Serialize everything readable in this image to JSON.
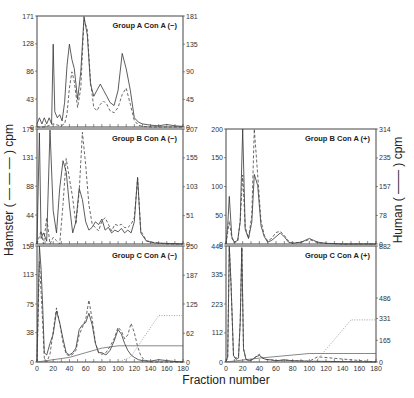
{
  "figure": {
    "xlabel": "Fraction number",
    "ylabel_left": "Hamster ( — — — ) cpm",
    "ylabel_right": "Human ( —— ) cpm"
  },
  "chart_data": [
    {
      "type": "line",
      "title": "Group A Con A (−)",
      "xlim": [
        0,
        180
      ],
      "xticks": [],
      "ylim_left": [
        0,
        171
      ],
      "yticks_left": [
        0,
        43,
        86,
        128,
        171
      ],
      "ylim_right": [
        0,
        181
      ],
      "yticks_right": [
        0,
        45,
        90,
        135,
        181
      ],
      "series": [
        {
          "name": "Human (solid)",
          "axis": "right",
          "x": [
            0,
            3,
            6,
            9,
            12,
            15,
            18,
            20,
            22,
            25,
            28,
            31,
            34,
            37,
            40,
            43,
            46,
            50,
            54,
            58,
            62,
            66,
            70,
            74,
            78,
            82,
            86,
            90,
            95,
            100,
            105,
            110,
            115,
            120,
            125,
            130,
            140,
            150,
            160,
            170,
            180
          ],
          "y": [
            5,
            15,
            5,
            15,
            5,
            15,
            5,
            135,
            25,
            15,
            20,
            10,
            40,
            100,
            135,
            110,
            95,
            45,
            90,
            180,
            150,
            70,
            50,
            60,
            70,
            60,
            50,
            40,
            35,
            60,
            120,
            95,
            60,
            15,
            8,
            5,
            3,
            2,
            4,
            2,
            1
          ]
        },
        {
          "name": "Hamster (dashed)",
          "axis": "left",
          "x": [
            0,
            10,
            20,
            25,
            30,
            34,
            37,
            40,
            43,
            46,
            50,
            54,
            58,
            62,
            66,
            70,
            74,
            78,
            82,
            86,
            90,
            95,
            100,
            105,
            110,
            115,
            120,
            125,
            130,
            140,
            150,
            160,
            170,
            180
          ],
          "y": [
            0,
            0,
            5,
            3,
            2,
            5,
            20,
            60,
            85,
            70,
            30,
            60,
            165,
            150,
            70,
            30,
            25,
            35,
            40,
            35,
            25,
            22,
            30,
            50,
            60,
            35,
            10,
            3,
            1,
            0,
            0,
            0,
            0,
            0
          ]
        }
      ]
    },
    {
      "type": "line",
      "title": "Group B Con A (−)",
      "xlim": [
        0,
        180
      ],
      "xticks": [],
      "ylim_left": [
        0,
        175
      ],
      "yticks_left": [
        0,
        44,
        88,
        131,
        175
      ],
      "ylim_right": [
        0,
        207
      ],
      "yticks_right": [
        0,
        51,
        103,
        155,
        207
      ],
      "series": [
        {
          "name": "Human (solid)",
          "axis": "right",
          "x": [
            0,
            3,
            5,
            8,
            12,
            16,
            20,
            24,
            28,
            32,
            36,
            40,
            44,
            48,
            52,
            56,
            60,
            64,
            68,
            72,
            76,
            80,
            84,
            88,
            92,
            96,
            100,
            104,
            108,
            112,
            116,
            120,
            124,
            128,
            135,
            145,
            160,
            180
          ],
          "y": [
            0,
            200,
            10,
            20,
            5,
            205,
            60,
            20,
            100,
            150,
            130,
            70,
            20,
            40,
            100,
            80,
            40,
            25,
            30,
            40,
            35,
            45,
            25,
            30,
            20,
            25,
            22,
            28,
            20,
            25,
            20,
            40,
            120,
            20,
            5,
            2,
            1,
            0
          ]
        },
        {
          "name": "Hamster (dashed)",
          "axis": "left",
          "x": [
            0,
            5,
            8,
            12,
            16,
            20,
            24,
            28,
            32,
            36,
            40,
            44,
            48,
            52,
            56,
            60,
            64,
            68,
            72,
            76,
            80,
            84,
            88,
            92,
            96,
            100,
            104,
            108,
            112,
            116,
            120,
            124,
            128,
            135,
            145,
            160,
            180
          ],
          "y": [
            0,
            20,
            0,
            40,
            0,
            10,
            5,
            0,
            60,
            130,
            100,
            70,
            30,
            80,
            170,
            120,
            60,
            30,
            25,
            20,
            35,
            40,
            30,
            20,
            30,
            28,
            30,
            25,
            25,
            30,
            40,
            100,
            20,
            5,
            2,
            0,
            0
          ]
        }
      ]
    },
    {
      "type": "line",
      "title": "Group C Con A (−)",
      "xlim": [
        0,
        180
      ],
      "xticks": [
        0,
        20,
        40,
        60,
        80,
        100,
        120,
        140,
        160,
        180
      ],
      "ylim_left": [
        0,
        150
      ],
      "yticks_left": [
        0,
        38,
        75,
        113,
        150
      ],
      "ylim_right": [
        0,
        250
      ],
      "yticks_right": [
        0,
        62,
        125,
        187,
        250
      ],
      "series": [
        {
          "name": "Human (solid)",
          "axis": "right",
          "x": [
            0,
            3,
            5,
            7,
            9,
            12,
            16,
            20,
            24,
            28,
            32,
            36,
            40,
            44,
            48,
            52,
            56,
            60,
            64,
            68,
            72,
            76,
            80,
            85,
            90,
            95,
            100,
            104,
            108,
            112,
            116,
            120,
            125,
            130,
            140,
            150,
            160,
            170,
            180
          ],
          "y": [
            0,
            250,
            200,
            120,
            20,
            15,
            40,
            60,
            110,
            85,
            50,
            20,
            15,
            20,
            30,
            70,
            80,
            85,
            105,
            80,
            40,
            20,
            20,
            15,
            25,
            45,
            70,
            60,
            40,
            25,
            15,
            10,
            5,
            3,
            2,
            5,
            3,
            1,
            0
          ]
        },
        {
          "name": "Hamster (dashed)",
          "axis": "left",
          "x": [
            0,
            3,
            5,
            7,
            9,
            12,
            16,
            20,
            24,
            28,
            32,
            36,
            40,
            44,
            48,
            52,
            56,
            60,
            64,
            68,
            72,
            76,
            80,
            85,
            90,
            95,
            100,
            104,
            108,
            112,
            116,
            120,
            124,
            128,
            132,
            136,
            140,
            150,
            160,
            170,
            180
          ],
          "y": [
            0,
            130,
            90,
            50,
            5,
            0,
            10,
            40,
            70,
            50,
            25,
            10,
            8,
            10,
            15,
            35,
            45,
            55,
            80,
            55,
            25,
            12,
            10,
            12,
            20,
            30,
            45,
            40,
            30,
            35,
            50,
            38,
            20,
            8,
            3,
            1,
            0,
            0,
            0,
            0,
            0
          ]
        },
        {
          "name": "Gradient (solid, flat)",
          "axis": "right",
          "x": [
            0,
            20,
            40,
            60,
            80,
            100,
            180
          ],
          "y": [
            0,
            5,
            10,
            20,
            30,
            35,
            35
          ]
        },
        {
          "name": "Gradient (dotted)",
          "axis": "right",
          "x": [
            0,
            100,
            115,
            150,
            180
          ],
          "y": [
            0,
            0,
            10,
            100,
            100
          ]
        }
      ]
    },
    {
      "type": "line",
      "title": "Group B Con A (+)",
      "xlim": [
        0,
        180
      ],
      "xticks": [],
      "ylim_left": [
        0,
        200
      ],
      "yticks_left": [
        0,
        50,
        100,
        150,
        200
      ],
      "ylim_right": [
        0,
        314
      ],
      "yticks_right": [
        0,
        78,
        157,
        235,
        314
      ],
      "series": [
        {
          "name": "Human (solid)",
          "axis": "right",
          "x": [
            0,
            2,
            4,
            7,
            10,
            14,
            17,
            20,
            23,
            27,
            31,
            34,
            38,
            42,
            46,
            50,
            55,
            60,
            65,
            70,
            75,
            80,
            90,
            95,
            100,
            105,
            110,
            120,
            140,
            160,
            180
          ],
          "y": [
            0,
            50,
            130,
            20,
            5,
            10,
            60,
            314,
            40,
            15,
            60,
            190,
            160,
            50,
            20,
            5,
            10,
            20,
            30,
            20,
            5,
            2,
            5,
            10,
            15,
            10,
            5,
            2,
            0,
            0,
            0
          ]
        },
        {
          "name": "Hamster (dashed)",
          "axis": "left",
          "x": [
            0,
            2,
            4,
            7,
            10,
            14,
            17,
            20,
            23,
            27,
            31,
            34,
            38,
            42,
            46,
            50,
            55,
            60,
            65,
            70,
            75,
            80,
            90,
            95,
            100,
            105,
            110,
            120,
            140,
            160,
            180
          ],
          "y": [
            0,
            20,
            40,
            10,
            2,
            5,
            40,
            120,
            30,
            10,
            50,
            200,
            120,
            40,
            15,
            5,
            10,
            20,
            22,
            15,
            5,
            2,
            3,
            5,
            8,
            5,
            2,
            1,
            0,
            0,
            0
          ]
        }
      ]
    },
    {
      "type": "line",
      "title": "Group C Con A (+)",
      "xlim": [
        0,
        180
      ],
      "xticks": [
        0,
        20,
        40,
        60,
        80,
        100,
        120,
        140,
        160,
        180
      ],
      "ylim_left": [
        0,
        446
      ],
      "yticks_left": [
        0,
        112,
        223,
        335,
        446
      ],
      "ylim_right": [
        0,
        882
      ],
      "yticks_right": [
        0,
        165,
        331,
        486,
        882
      ],
      "series": [
        {
          "name": "Human (solid)",
          "axis": "right",
          "x": [
            0,
            2,
            4,
            6,
            9,
            12,
            15,
            17,
            19,
            21,
            24,
            28,
            32,
            36,
            40,
            44,
            48,
            55,
            60,
            70,
            80,
            90,
            100,
            110,
            180
          ],
          "y": [
            0,
            40,
            880,
            600,
            50,
            20,
            30,
            300,
            870,
            100,
            20,
            10,
            20,
            40,
            50,
            30,
            20,
            15,
            10,
            15,
            10,
            8,
            5,
            5,
            0
          ]
        },
        {
          "name": "Hamster (dashed)",
          "axis": "left",
          "x": [
            0,
            2,
            4,
            6,
            9,
            12,
            15,
            17,
            19,
            21,
            24,
            28,
            32,
            36,
            40,
            44,
            48,
            55,
            60,
            70,
            80,
            90,
            100,
            110,
            180
          ],
          "y": [
            0,
            20,
            440,
            300,
            20,
            15,
            20,
            150,
            440,
            50,
            10,
            5,
            10,
            20,
            30,
            15,
            10,
            8,
            5,
            8,
            5,
            4,
            3,
            20,
            0
          ]
        },
        {
          "name": "Gradient (solid, flat)",
          "axis": "right",
          "x": [
            0,
            40,
            100,
            180
          ],
          "y": [
            0,
            30,
            65,
            65
          ]
        },
        {
          "name": "Gradient (dotted)",
          "axis": "right",
          "x": [
            0,
            108,
            150,
            180
          ],
          "y": [
            0,
            5,
            320,
            320
          ]
        }
      ]
    }
  ],
  "panels_layout": [
    {
      "x": 37,
      "y": 16,
      "w": 146,
      "h": 111
    },
    {
      "x": 37,
      "y": 129,
      "w": 146,
      "h": 115
    },
    {
      "x": 37,
      "y": 246,
      "w": 146,
      "h": 116
    },
    {
      "x": 226,
      "y": 129,
      "w": 150,
      "h": 115
    },
    {
      "x": 226,
      "y": 246,
      "w": 150,
      "h": 116
    }
  ]
}
